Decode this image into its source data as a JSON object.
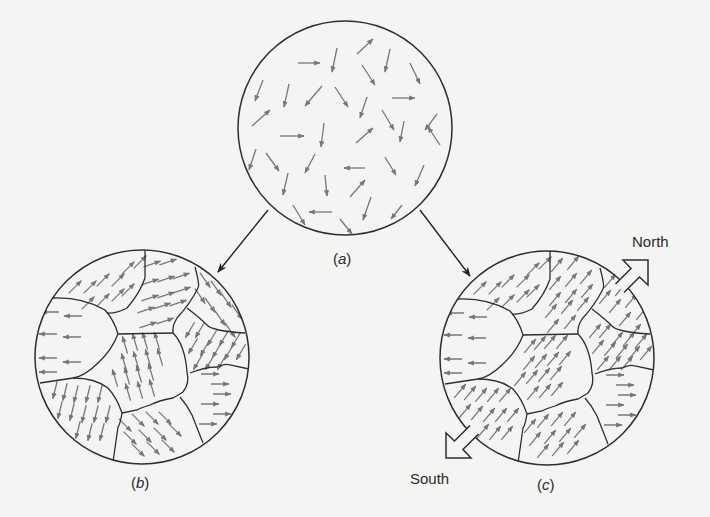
{
  "colors": {
    "background": "#f4f4f2",
    "outline": "#2e2e2e",
    "dipole_arrow": "#777777",
    "text": "#2b2b2b"
  },
  "labels": {
    "a": {
      "open": "(",
      "letter": "a",
      "close": ")"
    },
    "b": {
      "open": "(",
      "letter": "b",
      "close": ")"
    },
    "c": {
      "open": "(",
      "letter": "c",
      "close": ")"
    },
    "north": "North",
    "south": "South"
  },
  "panels": {
    "a": {
      "center": [
        345,
        128
      ],
      "radius": 107,
      "description": "random dipole orientations",
      "arrows": [
        [
          298,
          63,
          320,
          63
        ],
        [
          337,
          48,
          332,
          72
        ],
        [
          357,
          54,
          373,
          39
        ],
        [
          390,
          49,
          385,
          72
        ],
        [
          362,
          65,
          375,
          85
        ],
        [
          410,
          63,
          420,
          84
        ],
        [
          263,
          80,
          255,
          101
        ],
        [
          289,
          84,
          284,
          107
        ],
        [
          322,
          86,
          305,
          106
        ],
        [
          335,
          87,
          348,
          107
        ],
        [
          392,
          98,
          415,
          98
        ],
        [
          252,
          126,
          270,
          110
        ],
        [
          367,
          97,
          360,
          118
        ],
        [
          382,
          110,
          394,
          130
        ],
        [
          404,
          121,
          400,
          142
        ],
        [
          437,
          114,
          425,
          130
        ],
        [
          280,
          136,
          304,
          136
        ],
        [
          324,
          123,
          321,
          147
        ],
        [
          356,
          143,
          373,
          128
        ],
        [
          440,
          145,
          428,
          127
        ],
        [
          256,
          149,
          249,
          170
        ],
        [
          266,
          153,
          279,
          171
        ],
        [
          315,
          154,
          305,
          173
        ],
        [
          365,
          168,
          344,
          168
        ],
        [
          385,
          157,
          396,
          175
        ],
        [
          288,
          173,
          283,
          195
        ],
        [
          325,
          175,
          327,
          196
        ],
        [
          350,
          197,
          365,
          180
        ],
        [
          424,
          165,
          415,
          186
        ],
        [
          293,
          205,
          305,
          225
        ],
        [
          332,
          212,
          309,
          212
        ],
        [
          371,
          197,
          363,
          220
        ],
        [
          402,
          205,
          391,
          219
        ],
        [
          340,
          219,
          352,
          234
        ]
      ]
    },
    "b": {
      "center": [
        142,
        357
      ],
      "radius": 107,
      "boundaries": [
        "M145 250 L145 278 Q140 293 127 308 Q115 314 107 313",
        "M53 298 Q83 297 105 310 Q114 320 118 334",
        "M118 334 L173 333",
        "M195 267 Q200 285 198 288 Q190 304 177 318 Q172 326 173 333",
        "M187 308 Q200 318 207 325 Q212 331 245 333",
        "M118 334 Q112 350 98 363 Q85 376 73 378 L40 383",
        "M73 378 Q95 378 108 388 Q117 398 122 413 Q120 425 118 427 L113 462",
        "M173 333 Q185 345 187 372 Q190 383 183 392 Q175 397 173 398 Q160 400 150 405 Q140 408 137 410 L122 413",
        "M190 373 Q205 367 217 367 Q225 363 230 365 L249 369",
        "M180 397 Q187 405 192 415 L203 443"
      ],
      "domains": [
        {
          "name": "top-left",
          "dir": [
            1,
            -1
          ],
          "pts": [
            [
              75,
              287
            ],
            [
              90,
              287
            ],
            [
              103,
              280
            ],
            [
              118,
              280
            ],
            [
              88,
              303
            ],
            [
              103,
              300
            ],
            [
              118,
              295
            ],
            [
              128,
              290
            ],
            [
              128,
              268
            ],
            [
              140,
              262
            ]
          ]
        },
        {
          "name": "top-middle",
          "dir": [
            3,
            -1
          ],
          "pts": [
            [
              152,
              264
            ],
            [
              168,
              262
            ],
            [
              150,
              282
            ],
            [
              166,
              279
            ],
            [
              181,
              276
            ],
            [
              150,
              298
            ],
            [
              166,
              295
            ],
            [
              182,
              290
            ],
            [
              146,
              310
            ],
            [
              162,
              306
            ],
            [
              178,
              303
            ],
            [
              148,
              325
            ],
            [
              165,
              321
            ]
          ]
        },
        {
          "name": "left",
          "dir": [
            -1,
            0
          ],
          "pts": [
            [
              50,
              312
            ],
            [
              73,
              316
            ],
            [
              48,
              334
            ],
            [
              72,
              337
            ],
            [
              48,
              358
            ],
            [
              72,
              362
            ],
            [
              48,
              372
            ]
          ]
        },
        {
          "name": "center",
          "dir": [
            -0.3,
            -1
          ],
          "pts": [
            [
              125,
              345
            ],
            [
              135,
              342
            ],
            [
              145,
              341
            ],
            [
              157,
              341
            ],
            [
              124,
              362
            ],
            [
              136,
              360
            ],
            [
              148,
              358
            ],
            [
              160,
              357
            ],
            [
              115,
              378
            ],
            [
              127,
              376
            ],
            [
              139,
              374
            ],
            [
              151,
              372
            ],
            [
              128,
              392
            ],
            [
              140,
              390
            ],
            [
              152,
              388
            ]
          ]
        },
        {
          "name": "upper-right",
          "dir": [
            0.7,
            1
          ],
          "pts": [
            [
              205,
              280
            ],
            [
              216,
              288
            ],
            [
              226,
              300
            ],
            [
              237,
              312
            ],
            [
              200,
              296
            ],
            [
              210,
              305
            ],
            [
              220,
              318
            ],
            [
              230,
              330
            ]
          ]
        },
        {
          "name": "right-middle",
          "dir": [
            -0.6,
            1
          ],
          "pts": [
            [
              190,
              330
            ],
            [
              200,
              330
            ],
            [
              212,
              338
            ],
            [
              224,
              338
            ],
            [
              236,
              340
            ],
            [
              193,
              346
            ],
            [
              205,
              348
            ],
            [
              217,
              350
            ],
            [
              229,
              352
            ],
            [
              241,
              352
            ],
            [
              198,
              362
            ],
            [
              210,
              362
            ],
            [
              222,
              362
            ]
          ]
        },
        {
          "name": "lower-right",
          "dir": [
            1,
            0
          ],
          "pts": [
            [
              210,
              374
            ],
            [
              220,
              384
            ],
            [
              222,
              394
            ],
            [
              210,
              404
            ],
            [
              222,
              414
            ],
            [
              208,
              424
            ]
          ]
        },
        {
          "name": "lower-left",
          "dir": [
            -0.25,
            1
          ],
          "pts": [
            [
              55,
              390
            ],
            [
              65,
              392
            ],
            [
              76,
              394
            ],
            [
              88,
              394
            ],
            [
              100,
              394
            ],
            [
              60,
              410
            ],
            [
              72,
              412
            ],
            [
              84,
              414
            ],
            [
              96,
              414
            ],
            [
              108,
              414
            ],
            [
              78,
              430
            ],
            [
              90,
              432
            ],
            [
              102,
              432
            ]
          ]
        },
        {
          "name": "bottom",
          "dir": [
            1,
            1
          ],
          "pts": [
            [
              125,
              425
            ],
            [
              138,
              420
            ],
            [
              152,
              418
            ],
            [
              165,
              418
            ],
            [
              130,
              438
            ],
            [
              145,
              436
            ],
            [
              160,
              434
            ],
            [
              175,
              430
            ],
            [
              138,
              450
            ],
            [
              153,
              448
            ],
            [
              168,
              446
            ]
          ]
        }
      ]
    },
    "c": {
      "center": [
        547,
        358
      ],
      "radius": 107,
      "offset_from_b": [
        405,
        1
      ],
      "domains": [
        {
          "name": "top-left",
          "dir": [
            1,
            -1
          ]
        },
        {
          "name": "top-middle",
          "dir": [
            1,
            -1.2
          ]
        },
        {
          "name": "left",
          "dir": [
            -1,
            0
          ]
        },
        {
          "name": "center",
          "dir": [
            1,
            -1.2
          ]
        },
        {
          "name": "upper-right",
          "dir": [
            1,
            -1.2
          ]
        },
        {
          "name": "right-middle",
          "dir": [
            1,
            -1.2
          ]
        },
        {
          "name": "lower-right",
          "dir": [
            1,
            0
          ]
        },
        {
          "name": "lower-left",
          "dir": [
            1,
            -1.2
          ]
        },
        {
          "name": "bottom",
          "dir": [
            1,
            -1.2
          ]
        }
      ]
    }
  },
  "transition_arrows": [
    {
      "name": "arrow-a-to-b",
      "from": [
        268,
        210
      ],
      "to": [
        218,
        272
      ]
    },
    {
      "name": "arrow-a-to-c",
      "from": [
        420,
        210
      ],
      "to": [
        470,
        276
      ]
    }
  ],
  "field_arrows": {
    "north": {
      "tip": [
        648,
        260
      ],
      "dir": [
        1,
        -1
      ]
    },
    "south": {
      "tip": [
        446,
        458
      ],
      "dir": [
        -1,
        1
      ]
    }
  },
  "label_positions": {
    "a": [
      333,
      250
    ],
    "b": [
      131,
      474
    ],
    "c": [
      537,
      476
    ],
    "north": [
      632,
      233
    ],
    "south": [
      410,
      470
    ]
  }
}
